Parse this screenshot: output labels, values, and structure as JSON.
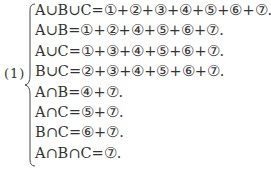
{
  "label": "(1)",
  "equations": [
    "A∪B∪C=①+②+③+④+⑤+⑥+⑦.",
    "A∪B=①+②+④+⑤+⑥+⑦.",
    "A∪C=①+③+④+⑤+⑥+⑦.",
    "B∪C=②+③+④+⑤+⑥+⑦.",
    "A∩B=④+⑦.",
    "A∩C=⑤+⑦.",
    "B∩C=⑥+⑦.",
    "A∩B∩C=⑦."
  ]
}
